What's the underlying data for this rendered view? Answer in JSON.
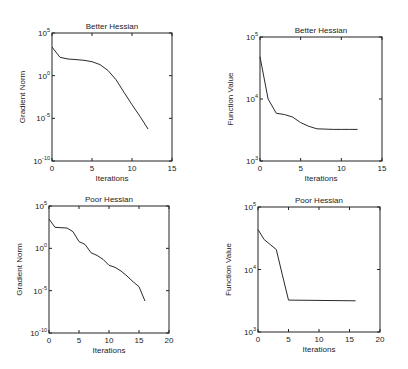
{
  "chart_data": [
    {
      "type": "line",
      "position": "top-left",
      "title": "Better Hessian",
      "xlabel": "Iterations",
      "ylabel": "Gradient Norm",
      "yscale": "log",
      "xlim": [
        0,
        15
      ],
      "ylim_log10": [
        -10,
        5
      ],
      "xticks": [
        0,
        5,
        10,
        15
      ],
      "yticks": [
        {
          "base": "10",
          "exp": "-10",
          "log": -10
        },
        {
          "base": "10",
          "exp": "-5",
          "log": -5
        },
        {
          "base": "10",
          "exp": "0",
          "log": 0
        },
        {
          "base": "10",
          "exp": "5",
          "log": 5
        }
      ],
      "grid": false,
      "series": [
        {
          "name": "gradient norm",
          "x": [
            0,
            1,
            2,
            3,
            4,
            5,
            6,
            7,
            8,
            9,
            10,
            11,
            12
          ],
          "log10_y": [
            3.36,
            2.15,
            1.95,
            1.88,
            1.8,
            1.64,
            1.3,
            0.6,
            -0.47,
            -1.95,
            -3.4,
            -4.77,
            -6.25
          ]
        }
      ]
    },
    {
      "type": "line",
      "position": "top-right",
      "title": "Better Hessian",
      "xlabel": "Iterations",
      "ylabel": "Function Value",
      "yscale": "log",
      "xlim": [
        0,
        15
      ],
      "ylim_log10": [
        3,
        5
      ],
      "xticks": [
        0,
        5,
        10,
        15
      ],
      "yticks": [
        {
          "base": "10",
          "exp": "3",
          "log": 3
        },
        {
          "base": "10",
          "exp": "4",
          "log": 4
        },
        {
          "base": "10",
          "exp": "5",
          "log": 5
        }
      ],
      "grid": false,
      "series": [
        {
          "name": "function value",
          "x": [
            0,
            1,
            2,
            3,
            4,
            5,
            6,
            7,
            8,
            9,
            10,
            11,
            12
          ],
          "log10_y": [
            4.68,
            4.0,
            3.77,
            3.75,
            3.71,
            3.62,
            3.56,
            3.52,
            3.515,
            3.51,
            3.51,
            3.51,
            3.51
          ]
        }
      ]
    },
    {
      "type": "line",
      "position": "bottom-left",
      "title": "Poor Hessian",
      "xlabel": "Iterations",
      "ylabel": "Gradient Norm",
      "yscale": "log",
      "xlim": [
        0,
        20
      ],
      "ylim_log10": [
        -10,
        5
      ],
      "xticks": [
        0,
        5,
        10,
        15,
        20
      ],
      "yticks": [
        {
          "base": "10",
          "exp": "-10",
          "log": -10
        },
        {
          "base": "10",
          "exp": "-5",
          "log": -5
        },
        {
          "base": "10",
          "exp": "0",
          "log": 0
        },
        {
          "base": "10",
          "exp": "5",
          "log": 5
        }
      ],
      "grid": false,
      "series": [
        {
          "name": "gradient norm",
          "x": [
            0,
            1,
            2,
            3,
            4,
            5,
            6,
            7,
            8,
            9,
            10,
            11,
            12,
            13,
            14,
            15,
            16
          ],
          "log10_y": [
            3.46,
            2.48,
            2.44,
            2.4,
            1.97,
            0.79,
            0.47,
            -0.51,
            -0.83,
            -1.3,
            -2.0,
            -2.24,
            -2.68,
            -3.27,
            -3.94,
            -4.53,
            -6.22
          ]
        }
      ]
    },
    {
      "type": "line",
      "position": "bottom-right",
      "title": "Poor Hessian",
      "xlabel": "Iterations",
      "ylabel": "Function Value",
      "yscale": "log",
      "xlim": [
        0,
        20
      ],
      "ylim_log10": [
        3,
        5
      ],
      "xticks": [
        0,
        5,
        10,
        15,
        20
      ],
      "yticks": [
        {
          "base": "10",
          "exp": "3",
          "log": 3
        },
        {
          "base": "10",
          "exp": "4",
          "log": 4
        },
        {
          "base": "10",
          "exp": "5",
          "log": 5
        }
      ],
      "grid": false,
      "series": [
        {
          "name": "function value",
          "x": [
            0,
            1,
            2,
            3,
            4,
            5,
            16
          ],
          "log10_y": [
            4.64,
            4.48,
            4.4,
            4.32,
            3.91,
            3.51,
            3.5
          ]
        }
      ]
    }
  ]
}
